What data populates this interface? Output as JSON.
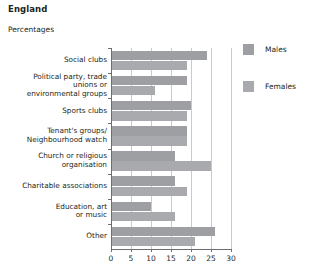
{
  "header": {
    "title": "England",
    "subtitle": "Percentages"
  },
  "legend": {
    "items": [
      {
        "label": "Males",
        "color": "#9d9fa2",
        "name": "legend-males"
      },
      {
        "label": "Females",
        "color": "#a8aaad",
        "name": "legend-females"
      }
    ]
  },
  "chart_data": {
    "type": "bar",
    "orientation": "horizontal",
    "title": "England",
    "subtitle": "Percentages",
    "xlabel": "",
    "ylabel": "",
    "xlim": [
      0,
      30
    ],
    "xticks": [
      0,
      5,
      10,
      15,
      20,
      25,
      30
    ],
    "xtick_labels": [
      "0",
      "5",
      "10",
      "15",
      "20",
      "25",
      "30"
    ],
    "grid": "vertical",
    "legend_position": "right",
    "categories": [
      "Social clubs",
      "Political party, trade unions or environmental groups",
      "Sports clubs",
      "Tenant's groups/ Neighbourhood watch",
      "Church or religious organisation",
      "Charitable associations",
      "Education, art or music",
      "Other"
    ],
    "category_lines": [
      [
        "Social clubs"
      ],
      [
        "Political party, trade",
        "unions or",
        "environmental groups"
      ],
      [
        "Sports clubs"
      ],
      [
        "Tenant's groups/",
        "Neighbourhood watch"
      ],
      [
        "Church or religious",
        "organisation"
      ],
      [
        "Charitable associations"
      ],
      [
        "Education, art",
        "or music"
      ],
      [
        "Other"
      ]
    ],
    "series": [
      {
        "name": "Males",
        "color": "#9d9fa2",
        "values": [
          24,
          19,
          20,
          19,
          16,
          16,
          10,
          26
        ]
      },
      {
        "name": "Females",
        "color": "#a8aaad",
        "values": [
          19,
          11,
          19,
          19,
          25,
          19,
          16,
          21
        ]
      }
    ]
  }
}
